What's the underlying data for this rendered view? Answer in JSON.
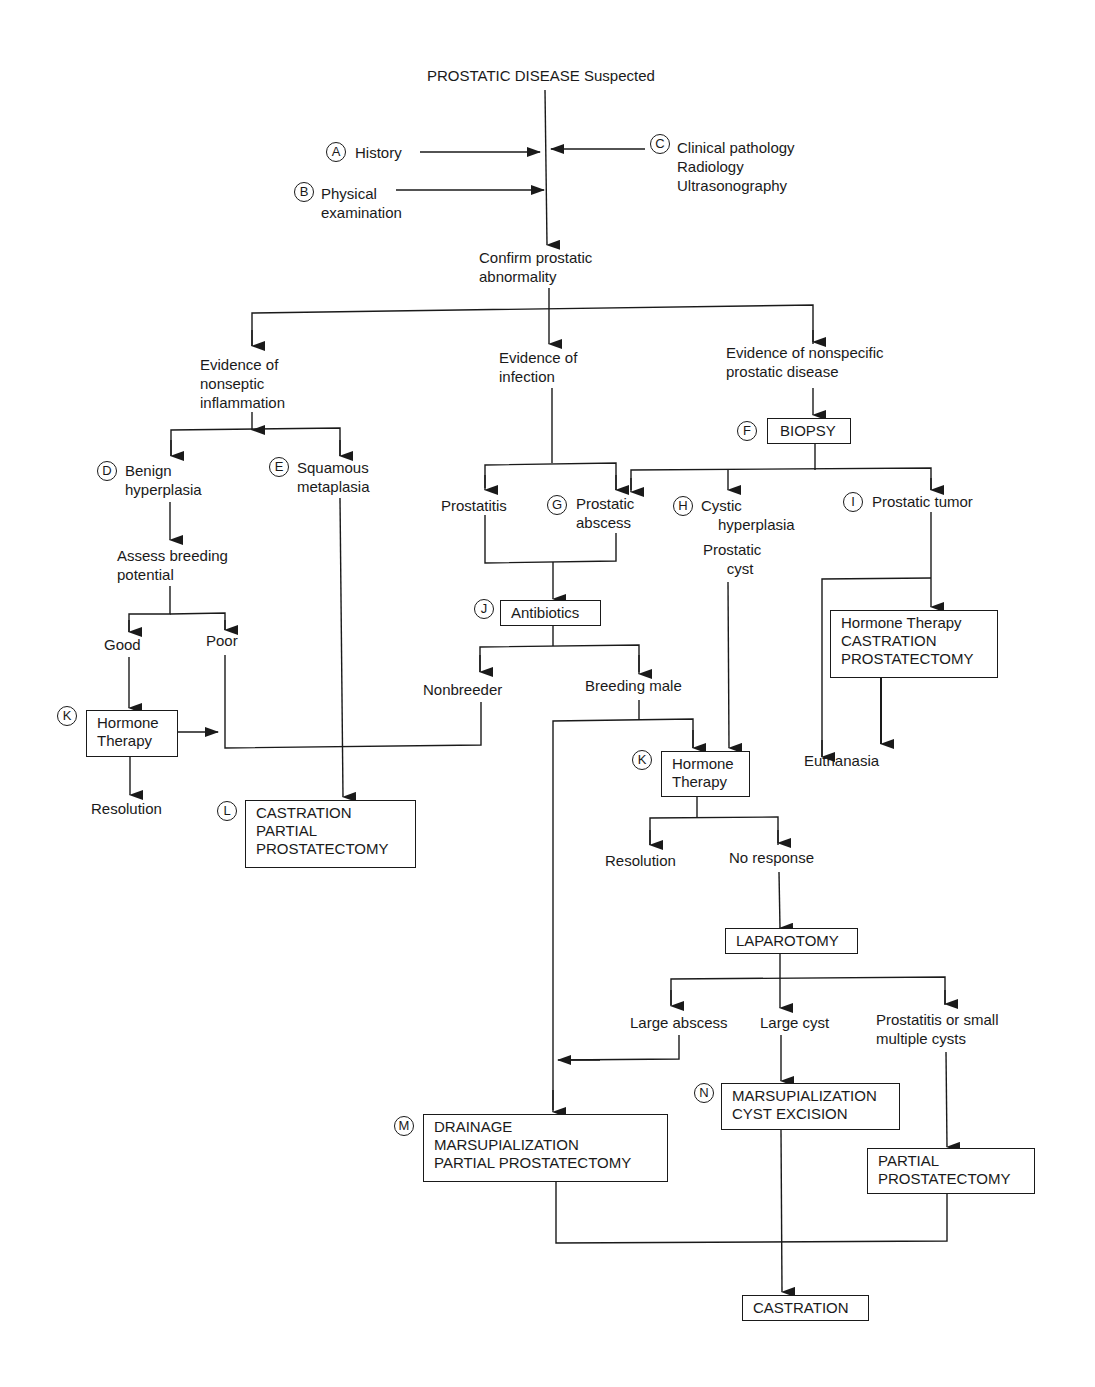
{
  "title": "PROSTATIC DISEASE Suspected",
  "inputs": {
    "history": {
      "marker": "A",
      "label": "History"
    },
    "physical": {
      "marker": "B",
      "lines": [
        "Physical",
        "examination"
      ]
    },
    "clinical": {
      "marker": "C",
      "lines": [
        "Clinical pathology",
        "Radiology",
        "Ultrasonography"
      ]
    }
  },
  "confirm": [
    "Confirm prostatic",
    "abnormality"
  ],
  "branches": {
    "nonseptic": [
      "Evidence of",
      "nonseptic",
      "inflammation"
    ],
    "infection": [
      "Evidence of",
      "infection"
    ],
    "nonspecific": [
      "Evidence of nonspecific",
      "prostatic disease"
    ]
  },
  "biopsy": {
    "marker": "F",
    "label": "BIOPSY"
  },
  "benign": {
    "marker": "D",
    "lines": [
      "Benign",
      "hyperplasia"
    ]
  },
  "squamous": {
    "marker": "E",
    "lines": [
      "Squamous",
      "metaplasia"
    ]
  },
  "assess": [
    "Assess breeding",
    "potential"
  ],
  "good": "Good",
  "poor": "Poor",
  "hormone_left": {
    "marker": "K",
    "lines": [
      "Hormone",
      "Therapy"
    ]
  },
  "resolution_left": "Resolution",
  "castration_partial": {
    "marker": "L",
    "lines": [
      "CASTRATION",
      "PARTIAL",
      "PROSTATECTOMY"
    ]
  },
  "prostatitis": "Prostatitis",
  "abscess": {
    "marker": "G",
    "lines": [
      "Prostatic",
      "abscess"
    ]
  },
  "cystic": {
    "marker": "H",
    "lines": [
      "Cystic",
      "hyperplasia"
    ]
  },
  "prostatic_cyst": [
    "Prostatic",
    "cyst"
  ],
  "tumor": {
    "marker": "I",
    "label": "Prostatic tumor"
  },
  "antibiotics": {
    "marker": "J",
    "label": "Antibiotics"
  },
  "nonbreeder": "Nonbreeder",
  "breeding_male": "Breeding male",
  "hormone_mid": {
    "marker": "K",
    "lines": [
      "Hormone",
      "Therapy"
    ]
  },
  "tumor_treatment": [
    "Hormone Therapy",
    "CASTRATION",
    "PROSTATECTOMY"
  ],
  "euthanasia": "Euthanasia",
  "resolution_mid": "Resolution",
  "no_response": "No response",
  "laparotomy": "LAPAROTOMY",
  "large_abscess": "Large abscess",
  "large_cyst": "Large cyst",
  "small_cysts": [
    "Prostatitis or small",
    "multiple cysts"
  ],
  "drainage": {
    "marker": "M",
    "lines": [
      "DRAINAGE",
      "MARSUPIALIZATION",
      "PARTIAL PROSTATECTOMY"
    ]
  },
  "marsup": {
    "marker": "N",
    "lines": [
      "MARSUPIALIZATION",
      "CYST EXCISION"
    ]
  },
  "partial_prost": [
    "PARTIAL",
    "PROSTATECTOMY"
  ],
  "castration_final": "CASTRATION"
}
